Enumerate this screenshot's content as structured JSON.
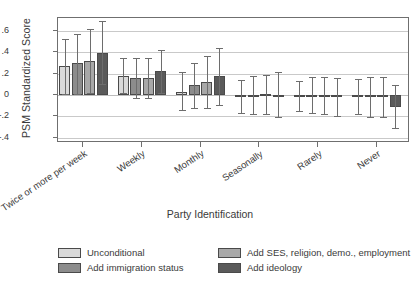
{
  "chart_data": {
    "type": "bar",
    "title": "",
    "xlabel": "Party Identification",
    "ylabel": "PSM Standardized Score",
    "ylim": [
      -0.45,
      0.72
    ],
    "yticks": [
      0.6,
      0.4,
      0.2,
      0,
      -0.2,
      -0.4
    ],
    "ytick_labels": [
      ".6",
      ".4",
      ".2",
      "0",
      "-.2",
      "-.4"
    ],
    "grid": true,
    "legend_position": "bottom",
    "categories": [
      "Twice or more per week",
      "Weekly",
      "Monthly",
      "Seasonally",
      "Rarely",
      "Never"
    ],
    "series": [
      {
        "name": "Unconditional",
        "color": "#d9d9d9",
        "values": [
          0.27,
          0.18,
          0.03,
          -0.01,
          -0.01,
          -0.01
        ],
        "ci_low": [
          0.01,
          0.02,
          -0.14,
          -0.17,
          -0.15,
          -0.18
        ],
        "ci_high": [
          0.52,
          0.35,
          0.21,
          0.14,
          0.13,
          0.15
        ]
      },
      {
        "name": "Add immigration status",
        "color": "#8c8c8c",
        "values": [
          0.3,
          0.16,
          0.09,
          0.0,
          0.0,
          -0.02
        ],
        "ci_low": [
          0.01,
          -0.03,
          -0.12,
          -0.18,
          -0.17,
          -0.21
        ],
        "ci_high": [
          0.57,
          0.35,
          0.3,
          0.18,
          0.17,
          0.17
        ]
      },
      {
        "name": "Add SES, religion, demo., employment",
        "color": "#a8a8a8",
        "values": [
          0.32,
          0.16,
          0.12,
          0.01,
          0.0,
          -0.02
        ],
        "ci_low": [
          0.02,
          -0.03,
          -0.12,
          -0.18,
          -0.18,
          -0.21
        ],
        "ci_high": [
          0.62,
          0.35,
          0.36,
          0.19,
          0.17,
          0.17
        ]
      },
      {
        "name": "Add ideology",
        "color": "#5a5a5a",
        "values": [
          0.39,
          0.22,
          0.18,
          0.0,
          -0.02,
          -0.11
        ],
        "ci_low": [
          0.1,
          0.02,
          -0.09,
          -0.21,
          -0.2,
          -0.31
        ],
        "ci_high": [
          0.69,
          0.42,
          0.44,
          0.21,
          0.16,
          0.09
        ]
      }
    ]
  },
  "legend": {
    "items": [
      {
        "label": "Unconditional"
      },
      {
        "label": "Add SES, religion, demo., employment"
      },
      {
        "label": "Add immigration status"
      },
      {
        "label": "Add ideology"
      }
    ]
  }
}
